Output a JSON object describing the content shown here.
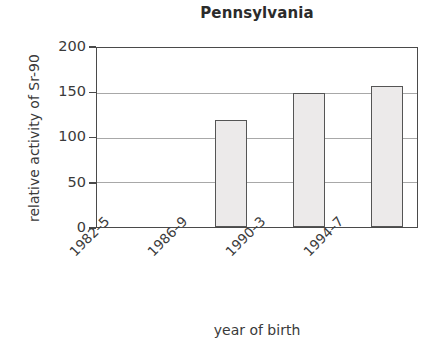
{
  "chart_data": {
    "type": "bar",
    "title": "Pennsylvania",
    "xlabel": "year of birth",
    "ylabel": "relative activity of Sr-90",
    "categories": [
      "1982–5",
      "1986–9",
      "1990–3",
      "1994–7"
    ],
    "values": [
      null,
      120,
      150,
      158
    ],
    "series": [
      {
        "name": "relative activity of Sr-90",
        "values": [
          null,
          120,
          150,
          158
        ]
      }
    ],
    "ylim": [
      0,
      200
    ],
    "yticks": [
      0,
      50,
      100,
      150,
      200
    ],
    "ytick_labels": [
      "0",
      "50",
      "100",
      "150",
      "200"
    ],
    "grid": true,
    "grid_axis": "y",
    "legend": false,
    "legend_position": "none",
    "bar_fill_color": "#eceaea",
    "bar_edge_color": "#555555",
    "axis_color": "#4a4a4a",
    "gridline_color": "#a8a8a8",
    "text_color": "#3a3a3a",
    "background_color": "#ffffff"
  }
}
